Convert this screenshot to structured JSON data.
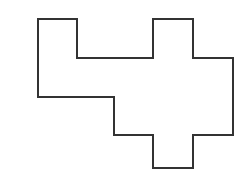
{
  "figure": {
    "title": "Irregular rectilinear polygon outline",
    "canvas": {
      "width": 249,
      "height": 181,
      "background_color": "#ffffff"
    },
    "style": {
      "stroke_color": "#333333",
      "stroke_width": 2,
      "fill_color": "#ffffff",
      "corner_style": "miter",
      "all_angles_degrees": 90
    },
    "shape": {
      "name": "rectilinear-polygon",
      "closed": true,
      "vertex_count": 16,
      "points": [
        [
          38,
          19
        ],
        [
          77,
          19
        ],
        [
          77,
          58
        ],
        [
          153,
          58
        ],
        [
          153,
          19
        ],
        [
          193,
          19
        ],
        [
          193,
          58
        ],
        [
          233,
          58
        ],
        [
          233,
          135
        ],
        [
          193,
          135
        ],
        [
          193,
          168
        ],
        [
          153,
          168
        ],
        [
          153,
          135
        ],
        [
          114,
          135
        ],
        [
          114,
          97
        ],
        [
          38,
          97
        ]
      ],
      "points_attr": "38,19 77,19 77,58 153,58 153,19 193,19 193,58 233,58 233,135 193,135 193,168 153,168 153,135 114,135 114,97 38,97",
      "bounding_box": {
        "x_min": 38,
        "y_min": 19,
        "x_max": 233,
        "y_max": 168,
        "width": 195,
        "height": 149
      },
      "grid_unit_px": 39,
      "features": [
        "top-left rectangular tab",
        "top-middle rectangular tab",
        "bottom-middle rectangular tab",
        "stepped lower-left notch"
      ]
    }
  }
}
